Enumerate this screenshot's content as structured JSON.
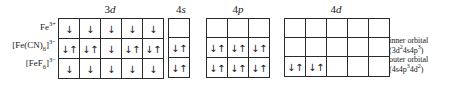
{
  "headers": [
    {
      "name": "3d",
      "n": "3",
      "letter": "d"
    },
    {
      "name": "4s",
      "n": "4",
      "letter": "s"
    },
    {
      "name": "4p",
      "n": "4",
      "letter": "p"
    },
    {
      "name": "4d",
      "n": "4",
      "letter": "d"
    }
  ],
  "row_labels": [
    {
      "id": "fe3plus",
      "text": "Fe3+"
    },
    {
      "id": "hexacyanoferrate",
      "text": "[Fe(CN)6]3-"
    },
    {
      "id": "hexafluoroferrate",
      "text": "[FeF6]3-"
    }
  ],
  "orbitals": {
    "d3": {
      "label": "3d",
      "boxes": 5,
      "rows": [
        [
          "↓",
          "↓",
          "↓",
          "↓",
          "↓"
        ],
        [
          "↓↑",
          "↓↑",
          "↓",
          "↓↑",
          "↓↑"
        ],
        [
          "↓",
          "↓",
          "↓",
          "↓",
          "↓"
        ]
      ]
    },
    "s4": {
      "label": "4s",
      "boxes": 1,
      "rows": [
        [
          ""
        ],
        [
          "↓↑"
        ],
        [
          "↓↑"
        ]
      ]
    },
    "p4": {
      "label": "4p",
      "boxes": 3,
      "rows": [
        [
          "",
          "",
          ""
        ],
        [
          "↓↑",
          "↓↑",
          "↓↑"
        ],
        [
          "↓↑",
          "↓↑",
          "↓↑"
        ]
      ]
    },
    "d4": {
      "label": "4d",
      "boxes": 5,
      "rows": [
        [
          "",
          "",
          "",
          "",
          ""
        ],
        [
          "",
          "",
          "",
          "",
          ""
        ],
        [
          "↓↑",
          "↓↑",
          "",
          "",
          ""
        ]
      ]
    }
  },
  "notes": [
    {
      "id": "inner",
      "line1": "inner orbital",
      "line2_prefix": "(3d",
      "line2_sup1": "2",
      "line2_mid": "4s4p",
      "line2_sup2": "3",
      "line2_suffix": ")"
    },
    {
      "id": "outer",
      "line1": "outer orbital",
      "line2_prefix": "(4s4p",
      "line2_sup1": "3",
      "line2_mid": "4d",
      "line2_sup2": "2",
      "line2_suffix": ")"
    }
  ],
  "colors": {
    "line": "#2b2b2b",
    "text": "#1a1a1a",
    "background": "#ffffff"
  }
}
